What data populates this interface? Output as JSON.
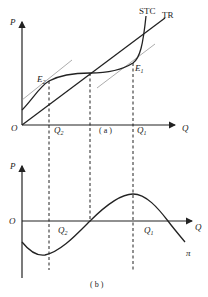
{
  "panel_a": {
    "caption": "( a )",
    "y_axis_label": "P",
    "x_axis_label": "Q",
    "origin_label": "O",
    "curves": {
      "stc_label": "STC",
      "tr_label": "TR"
    },
    "points": {
      "e1_label": "E",
      "e1_sub": "1",
      "e2_label": "E",
      "e2_sub": "2"
    },
    "ticks": {
      "q1_label": "Q",
      "q1_sub": "1",
      "q2_label": "Q",
      "q2_sub": "2"
    }
  },
  "panel_b": {
    "caption": "( b )",
    "y_axis_label": "P",
    "x_axis_label": "Q",
    "origin_label": "O",
    "curve_label": "π",
    "ticks": {
      "q1_label": "Q",
      "q1_sub": "1",
      "q2_label": "Q",
      "q2_sub": "2"
    }
  },
  "colors": {
    "line": "#222222",
    "tangent": "#777777",
    "background": "#ffffff"
  }
}
